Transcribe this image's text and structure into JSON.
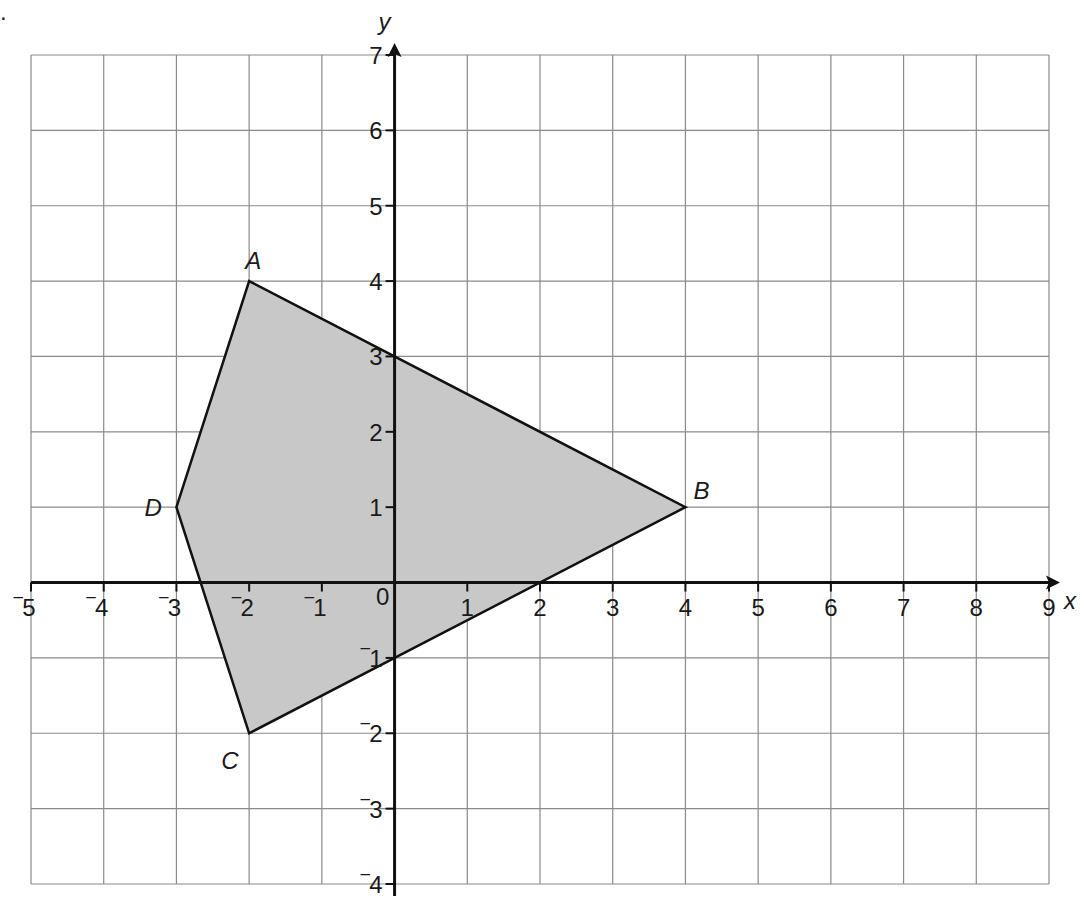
{
  "question_marker": ".",
  "chart_data": {
    "type": "coordinate-grid-polygon",
    "title": "",
    "xlabel": "x",
    "ylabel": "y",
    "xlim": [
      -5,
      9
    ],
    "ylim": [
      -4,
      7
    ],
    "grid": true,
    "x_ticks": [
      -5,
      -4,
      -3,
      -2,
      -1,
      0,
      1,
      2,
      3,
      4,
      5,
      6,
      7,
      8,
      9
    ],
    "y_ticks": [
      -4,
      -3,
      -2,
      -1,
      1,
      2,
      3,
      4,
      5,
      6,
      7
    ],
    "x_tick_labels": [
      "‾5",
      "‾4",
      "‾3",
      "‾2",
      "‾1",
      "0",
      "1",
      "2",
      "3",
      "4",
      "5",
      "6",
      "7",
      "8",
      "9"
    ],
    "y_tick_labels": [
      "‾4",
      "‾3",
      "‾2",
      "‾1",
      "1",
      "2",
      "3",
      "4",
      "5",
      "6",
      "7"
    ],
    "polygon": {
      "name": "ABCD",
      "fill": "#c8c8c8",
      "stroke": "#111111",
      "vertices": [
        {
          "label": "A",
          "x": -2,
          "y": 4
        },
        {
          "label": "B",
          "x": 4,
          "y": 1
        },
        {
          "label": "C",
          "x": -2,
          "y": -2
        },
        {
          "label": "D",
          "x": -3,
          "y": 1
        }
      ]
    }
  },
  "colors": {
    "grid": "#8a8a8a",
    "axis": "#111111",
    "shape_fill": "#c8c8c8",
    "background": "#ffffff"
  }
}
